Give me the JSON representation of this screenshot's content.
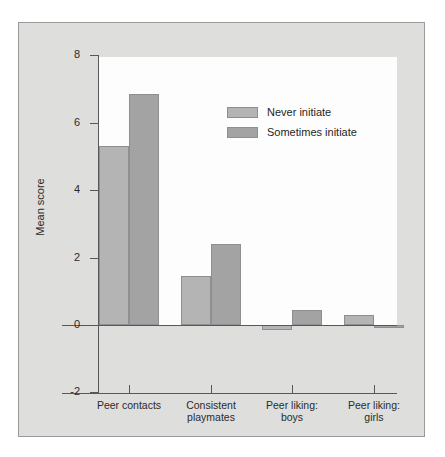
{
  "chart_data": {
    "type": "bar",
    "title": "",
    "subtitle": "",
    "xlabel": "",
    "ylabel": "Mean score",
    "categories": [
      "Peer contacts",
      "Consistent playmates",
      "Peer liking: boys",
      "Peer liking: girls"
    ],
    "category_lines": [
      [
        "Peer contacts"
      ],
      [
        "Consistent",
        "playmates"
      ],
      [
        "Peer liking:",
        "boys"
      ],
      [
        "Peer liking:",
        "girls"
      ]
    ],
    "series": [
      {
        "name": "Never initiate",
        "color": "#b4b4b4",
        "values": [
          5.3,
          1.45,
          -0.15,
          0.3
        ]
      },
      {
        "name": "Sometimes initiate",
        "color": "#a3a3a3",
        "values": [
          6.85,
          2.4,
          0.45,
          -0.1
        ]
      }
    ],
    "ylim": [
      -2,
      8
    ],
    "yticks": [
      8,
      6,
      4,
      2,
      0,
      -2
    ],
    "ytick_labels": [
      "8",
      "6",
      "4",
      "2",
      "0",
      "-2"
    ],
    "grid": false,
    "legend_position": "top-right",
    "legend_entries": [
      "Never initiate",
      "Sometimes initiate"
    ]
  },
  "colors": {
    "figure_background": "#dededd",
    "panel_background": "#fdfdfd",
    "axis": "#56585a",
    "bar_edge": "#8d8f91",
    "text": "#2b2b2b"
  }
}
